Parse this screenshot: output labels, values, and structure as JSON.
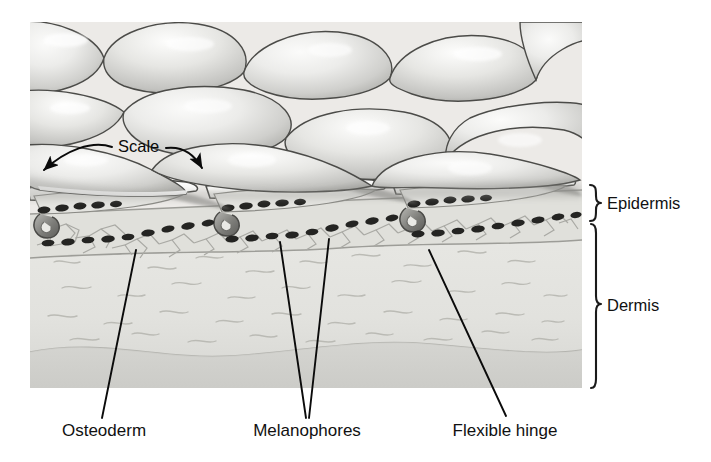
{
  "figure": {
    "illustration_style": "grayscale pencil/airbrush scientific illustration",
    "panel": {
      "x": 30,
      "y": 22,
      "width": 552,
      "height": 366
    }
  },
  "callouts": {
    "scale": {
      "label": "Scale",
      "x": 118,
      "y": 152,
      "arrows": [
        {
          "name": "scale-arrow-left",
          "from_x": 82,
          "from_y": 148,
          "to_x": 42,
          "to_y": 172
        },
        {
          "name": "scale-arrow-right",
          "from_x": 152,
          "from_y": 152,
          "to_x": 192,
          "to_y": 168
        }
      ]
    },
    "bottom": [
      {
        "id": "osteoderm",
        "label": "Osteoderm",
        "text_x": 104,
        "text_y": 436,
        "leaders": [
          {
            "x1": 136,
            "y1": 250,
            "x2": 102,
            "y2": 418
          }
        ]
      },
      {
        "id": "melanophores",
        "label": "Melanophores",
        "text_x": 281,
        "text_y": 436,
        "leaders": [
          {
            "x1": 280,
            "y1": 242,
            "x2": 306,
            "y2": 418
          },
          {
            "x1": 329,
            "y1": 239,
            "x2": 309,
            "y2": 418
          }
        ]
      },
      {
        "id": "flexible-hinge",
        "label": "Flexible hinge",
        "text_x": 443,
        "text_y": 436,
        "leaders": [
          {
            "x1": 429,
            "y1": 250,
            "x2": 506,
            "y2": 416
          }
        ]
      }
    ]
  },
  "side_brackets": [
    {
      "id": "epidermis",
      "label": "Epidermis",
      "top": 184,
      "bottom": 222,
      "label_x": 608,
      "label_y": 209
    },
    {
      "id": "dermis",
      "label": "Dermis",
      "top": 223,
      "bottom": 388,
      "label_x": 608,
      "label_y": 311
    }
  ],
  "colors": {
    "ink": "#0b0b0b",
    "panel_background": "#e9e9e6",
    "scale_light": "#f2f2f0",
    "scale_mid": "#c9c9c6",
    "scale_dark": "#8e8e8b",
    "outline": "#3a3a38",
    "melanophore": "#2b2b2b",
    "osteoderm_fill": "#dcdcd8",
    "dermis_fill": "#e4e4e0",
    "hinge_shadow": "#6f6f6c"
  },
  "anatomy": {
    "layers": [
      "Epidermis",
      "Dermis"
    ],
    "structures": [
      "Scale",
      "Osteoderm",
      "Melanophores",
      "Flexible hinge"
    ],
    "scale_rows": 3,
    "scale_units_visible": 11,
    "melanophore_rows": 2
  }
}
